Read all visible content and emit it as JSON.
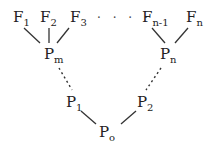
{
  "diagram": {
    "top_nodes": [
      {
        "base": "F",
        "sub": "1"
      },
      {
        "base": "F",
        "sub": "2"
      },
      {
        "base": "F",
        "sub": "3"
      },
      {
        "base": "F",
        "sub": "n-1"
      },
      {
        "base": "F",
        "sub": "n"
      }
    ],
    "ellipsis": "· · · ·",
    "mid_nodes": [
      {
        "base": "P",
        "sub": "m"
      },
      {
        "base": "P",
        "sub": "n"
      }
    ],
    "lower_nodes": [
      {
        "base": "P",
        "sub": "1"
      },
      {
        "base": "P",
        "sub": "2"
      }
    ],
    "root": {
      "base": "P",
      "sub": "o"
    },
    "edges": [
      {
        "from": "F1",
        "to": "Pm",
        "style": "solid"
      },
      {
        "from": "F2",
        "to": "Pm",
        "style": "solid"
      },
      {
        "from": "F3",
        "to": "Pm",
        "style": "solid"
      },
      {
        "from": "Fn-1",
        "to": "Pn",
        "style": "solid"
      },
      {
        "from": "Fn",
        "to": "Pn",
        "style": "solid"
      },
      {
        "from": "Pm",
        "to": "P1",
        "style": "dashed"
      },
      {
        "from": "Pn",
        "to": "P2",
        "style": "dashed"
      },
      {
        "from": "P1",
        "to": "Po",
        "style": "solid"
      },
      {
        "from": "P2",
        "to": "Po",
        "style": "solid"
      }
    ]
  }
}
